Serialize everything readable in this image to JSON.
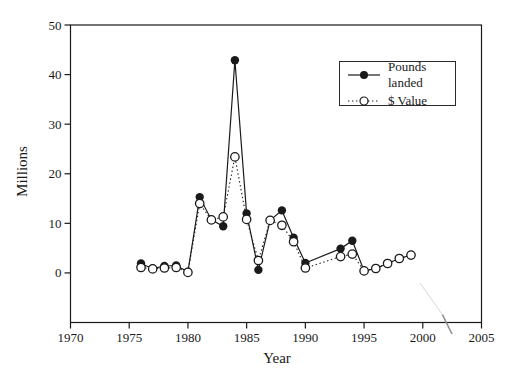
{
  "figure": {
    "background": "#ffffff",
    "ink": "#1a1a1a",
    "artifact_color_light": "#d9d9d9",
    "artifact_color_dark": "#8f8f8f"
  },
  "legend": {
    "items": [
      {
        "label": "Pounds landed",
        "marker": "filled-circle",
        "line": "solid"
      },
      {
        "label": "$ Value",
        "marker": "open-circle",
        "line": "dotted"
      }
    ],
    "position": "upper-right"
  },
  "chart_data": {
    "type": "line",
    "title": "",
    "xlabel": "Year",
    "ylabel": "Millions",
    "xlim": [
      1970,
      2005
    ],
    "ylim": [
      -10,
      50
    ],
    "x_ticks": [
      1970,
      1975,
      1980,
      1985,
      1990,
      1995,
      2000,
      2005
    ],
    "y_ticks": [
      0,
      10,
      20,
      30,
      40,
      50
    ],
    "grid": false,
    "legend_position": "upper right",
    "series": [
      {
        "name": "Pounds landed",
        "marker": "filled-circle",
        "line": "solid",
        "points": [
          [
            1976,
            1.9
          ],
          [
            1977,
            0.85
          ],
          [
            1978,
            1.4
          ],
          [
            1979,
            1.5
          ],
          [
            1980,
            0.2
          ],
          [
            1981,
            15.3
          ],
          [
            1982,
            10.7
          ],
          [
            1983,
            9.4
          ],
          [
            1984,
            42.9
          ],
          [
            1985,
            12.0
          ],
          [
            1986,
            0.6
          ],
          [
            1987,
            10.6
          ],
          [
            1988,
            12.6
          ],
          [
            1989,
            7.1
          ],
          [
            1990,
            2.0
          ],
          [
            1993,
            4.9
          ],
          [
            1994,
            6.5
          ],
          [
            1995,
            0.4
          ],
          [
            1996,
            0.9
          ],
          [
            1997,
            1.9
          ],
          [
            1998,
            2.9
          ],
          [
            1999,
            3.6
          ]
        ]
      },
      {
        "name": "$ Value",
        "marker": "open-circle",
        "line": "dotted",
        "points": [
          [
            1976,
            1.1
          ],
          [
            1977,
            0.8
          ],
          [
            1978,
            1.0
          ],
          [
            1979,
            1.1
          ],
          [
            1980,
            0.1
          ],
          [
            1981,
            14.0
          ],
          [
            1982,
            10.7
          ],
          [
            1983,
            11.3
          ],
          [
            1984,
            23.4
          ],
          [
            1985,
            10.8
          ],
          [
            1986,
            2.5
          ],
          [
            1987,
            10.6
          ],
          [
            1988,
            9.6
          ],
          [
            1989,
            6.3
          ],
          [
            1990,
            1.0
          ],
          [
            1993,
            3.3
          ],
          [
            1994,
            3.8
          ],
          [
            1995,
            0.4
          ],
          [
            1996,
            0.9
          ],
          [
            1997,
            1.9
          ],
          [
            1998,
            2.9
          ],
          [
            1999,
            3.6
          ]
        ]
      }
    ],
    "annotations": [
      {
        "name": "scan-artifact",
        "type": "stray-mark",
        "x_from": 420,
        "y_from": 283,
        "x_to": 452,
        "y_to": 334
      }
    ]
  }
}
